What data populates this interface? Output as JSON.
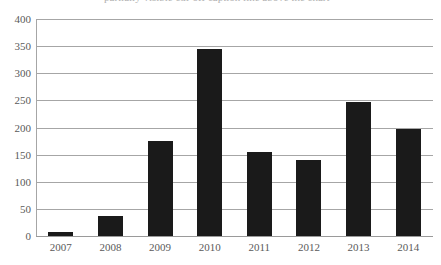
{
  "caption": {
    "text": "partially visible cut-off caption line above the chart"
  },
  "chart_data": {
    "type": "bar",
    "title": "",
    "xlabel": "",
    "ylabel": "",
    "categories": [
      "2007",
      "2008",
      "2009",
      "2010",
      "2011",
      "2012",
      "2013",
      "2014"
    ],
    "values": [
      8,
      36,
      176,
      344,
      155,
      140,
      247,
      197
    ],
    "ylim": [
      0,
      400
    ],
    "ytick_step": 50,
    "yticks": [
      "400",
      "350",
      "300",
      "250",
      "200",
      "150",
      "100",
      "50",
      "0"
    ],
    "ytick_values": [
      400,
      350,
      300,
      250,
      200,
      150,
      100,
      50,
      0
    ],
    "grid": true,
    "legend": false,
    "series_color": "#1a1a1a",
    "gridline_color": "#a6a6a6",
    "axis_text_color": "#5a5a5a"
  }
}
